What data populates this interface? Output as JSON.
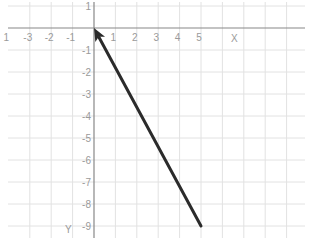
{
  "chart_data": {
    "type": "line",
    "title": "",
    "xlabel": "X",
    "ylabel": "Y",
    "xlim": [
      -4,
      10
    ],
    "ylim": [
      -9.5,
      1.3
    ],
    "grid": true,
    "x_ticks": [
      "1",
      "-3",
      "-2",
      "-1",
      "1",
      "2",
      "3",
      "4",
      "5"
    ],
    "x_tick_values": [
      -4,
      -3,
      -2,
      -1,
      1,
      2,
      3,
      4,
      5
    ],
    "y_ticks": [
      "1",
      "-1",
      "-2",
      "-3",
      "-4",
      "-5",
      "-6",
      "-7",
      "-8",
      "-9"
    ],
    "y_tick_values": [
      1,
      -1,
      -2,
      -3,
      -4,
      -5,
      -6,
      -7,
      -8,
      -9
    ],
    "series": [
      {
        "name": "vector",
        "style": "arrow",
        "color": "#2b2b2b",
        "from": {
          "x": 5,
          "y": -9
        },
        "to": {
          "x": 0,
          "y": 0
        },
        "points": [
          {
            "x": 5,
            "y": -9
          },
          {
            "x": 0,
            "y": 0
          }
        ]
      }
    ]
  },
  "colors": {
    "grid": "#e2e2e2",
    "axis": "#888888",
    "tick_label": "#9a9a9a",
    "vector": "#2b2b2b"
  }
}
